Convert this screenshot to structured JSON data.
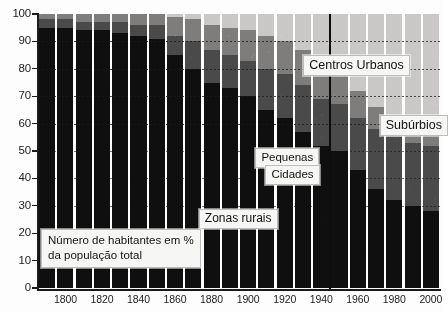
{
  "chart_data": {
    "type": "bar",
    "stacked": true,
    "stack_mode": "percent",
    "title": "",
    "subtitle": "",
    "caption": "Número de habitantes em % da população total",
    "xlabel": "",
    "ylabel": "",
    "ylim": [
      0,
      100
    ],
    "ytick_labels": [
      "0",
      "10",
      "20",
      "30",
      "40",
      "50",
      "60",
      "70",
      "80",
      "90",
      "100"
    ],
    "ytick_values": [
      0,
      10,
      20,
      30,
      40,
      50,
      60,
      70,
      80,
      90,
      100
    ],
    "xtick_labels": [
      "1800",
      "1820",
      "1840",
      "1860",
      "1880",
      "1900",
      "1920",
      "1940",
      "1960",
      "1980",
      "2000"
    ],
    "xtick_values": [
      1800,
      1820,
      1840,
      1860,
      1880,
      1900,
      1920,
      1940,
      1960,
      1980,
      2000
    ],
    "grid": "horizontal-dotted",
    "legend_position": "in-plot-callouts",
    "x": [
      1790,
      1800,
      1810,
      1820,
      1830,
      1840,
      1850,
      1860,
      1870,
      1880,
      1890,
      1900,
      1910,
      1920,
      1930,
      1940,
      1950,
      1960,
      1970,
      1980,
      1990,
      2000
    ],
    "categories": [
      "1790",
      "1800",
      "1810",
      "1820",
      "1830",
      "1840",
      "1850",
      "1860",
      "1870",
      "1880",
      "1890",
      "1900",
      "1910",
      "1920",
      "1930",
      "1940",
      "1950",
      "1960",
      "1970",
      "1980",
      "1990",
      "2000"
    ],
    "series": [
      {
        "name": "Zonas rurais",
        "color": "#100f0f",
        "values": [
          95,
          95,
          94,
          94,
          93,
          92,
          91,
          85,
          80,
          75,
          73,
          70,
          65,
          62,
          57,
          52,
          50,
          43,
          36,
          32,
          30,
          28
        ]
      },
      {
        "name": "Centros Urbanos",
        "color": "#4b4a4a",
        "values": [
          3,
          3,
          3,
          3,
          4,
          4,
          5,
          7,
          10,
          12,
          12,
          13,
          15,
          16,
          17,
          17,
          17,
          19,
          22,
          23,
          23,
          24
        ]
      },
      {
        "name": "Pequenas Cidades",
        "color": "#7e7d7c",
        "values": [
          2,
          2,
          3,
          3,
          3,
          4,
          4,
          7,
          8,
          9,
          10,
          11,
          12,
          12,
          13,
          13,
          12,
          10,
          8,
          7,
          7,
          7
        ]
      },
      {
        "name": "Subúrbios",
        "color": "#c9c8c6",
        "values": [
          0,
          0,
          0,
          0,
          0,
          0,
          0,
          1,
          2,
          4,
          5,
          6,
          8,
          10,
          13,
          18,
          21,
          28,
          34,
          38,
          40,
          41
        ]
      }
    ],
    "guides": [
      90,
      80,
      70,
      60,
      50,
      40,
      30
    ],
    "annotations": [
      {
        "name": "centros-urbanos",
        "text": "Centros Urbanos",
        "x_pct": 66,
        "y_pct": 85
      },
      {
        "name": "suburbios",
        "text": "Subúrbios",
        "x_pct": 85,
        "y_pct": 63
      },
      {
        "name": "pequenas-cidades-line1",
        "text": "Pequenas",
        "x_pct": 63,
        "y_pct": 51
      },
      {
        "name": "pequenas-cidades-line2",
        "text": "Cidades",
        "x_pct": 66,
        "y_pct": 45
      },
      {
        "name": "zonas-rurais",
        "text": "Zonas rurais",
        "x_pct": 40,
        "y_pct": 29
      }
    ]
  },
  "labels": {
    "centros_urbanos": "Centros Urbanos",
    "suburbios": "Subúrbios",
    "pequenas": "Pequenas",
    "cidades": "Cidades",
    "zonas_rurais": "Zonas rurais",
    "caption_line1": "Número de habitantes em %",
    "caption_line2": "da população total"
  },
  "colors": {
    "rural": "#100f0f",
    "urban_centers": "#4b4a4a",
    "small_towns": "#7e7d7c",
    "suburbs": "#c9c8c6",
    "axis": "#1b1b1b",
    "background": "#fdfdfd",
    "callout_bg": "#f6f6f4"
  }
}
